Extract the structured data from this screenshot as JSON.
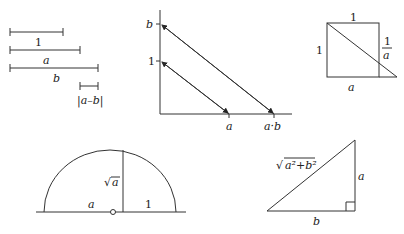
{
  "figures": {
    "segments": {
      "labels": {
        "one": "1",
        "a": "a",
        "b": "b",
        "diff": "|a–b|"
      }
    },
    "multiplication": {
      "labels": {
        "y_b": "b",
        "y_one": "1",
        "x_a": "a",
        "x_ab": "a·b"
      }
    },
    "reciprocal": {
      "labels": {
        "top": "1",
        "left": "1",
        "right_num": "1",
        "right_den": "a",
        "bottom": "a"
      }
    },
    "square_root": {
      "labels": {
        "height": "√",
        "height_var": "a",
        "left": "a",
        "right": "1"
      }
    },
    "hypotenuse": {
      "labels": {
        "hyp_root": "√",
        "hyp_expr": "a²+b²",
        "vertical": "a",
        "base": "b"
      }
    }
  },
  "colors": {
    "stroke": "#333333",
    "text": "#222222",
    "background": "#ffffff"
  }
}
